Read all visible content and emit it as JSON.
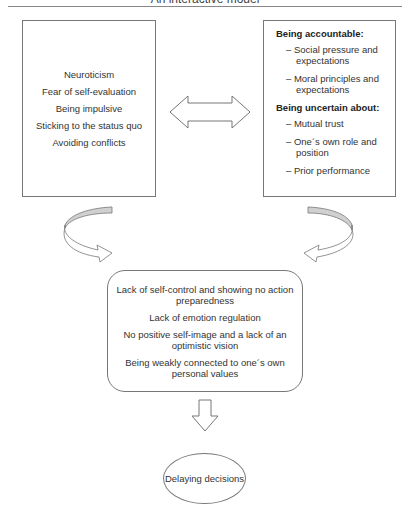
{
  "header": {
    "title": "An interactive model"
  },
  "left_box": {
    "items": [
      "Neuroticism",
      "Fear of self-evaluation",
      "Being impulsive",
      "Sticking to the status quo",
      "Avoiding conflicts"
    ]
  },
  "right_box": {
    "section1": {
      "heading": "Being accountable:",
      "items": [
        "– Social pressure and expectations",
        "– Moral principles and expectations"
      ]
    },
    "section2": {
      "heading": "Being uncertain about:",
      "items": [
        "– Mutual trust",
        "– One´s own role and position",
        "– Prior performance"
      ]
    }
  },
  "center_box": {
    "items": [
      "Lack of self-control and showing no action preparedness",
      "Lack of emotion regulation",
      "No positive self-image and a lack of an optimistic vision",
      "Being weakly connected to one´s own personal values"
    ]
  },
  "outcome": {
    "label": "Delaying decisions"
  },
  "icons": {
    "double_arrow": "double-headed-arrow",
    "left_curved_arrow": "curved-arrow-right",
    "right_curved_arrow": "curved-arrow-left",
    "down_arrow": "down-arrow"
  },
  "colors": {
    "stroke": "#777777",
    "arrow_fill": "#d0d0d0"
  }
}
